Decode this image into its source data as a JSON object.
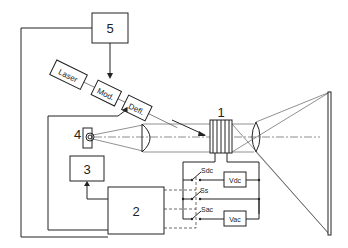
{
  "diagram": {
    "type": "optical-electrical schematic",
    "blocks": {
      "b5": {
        "label": "5"
      },
      "b3": {
        "label": "3"
      },
      "b2": {
        "label": "2"
      },
      "laser": {
        "label": "Laser"
      },
      "mod": {
        "label": "Mod."
      },
      "defl": {
        "label": "Defl."
      },
      "vdc": {
        "label": "Vdc"
      },
      "vac": {
        "label": "Vac"
      }
    },
    "labels": {
      "element1": "1",
      "element4": "4",
      "sdc": "Sdc",
      "ss": "Ss",
      "sac": "Sac"
    },
    "colors": {
      "line": "#222222",
      "background": "#ffffff"
    }
  }
}
